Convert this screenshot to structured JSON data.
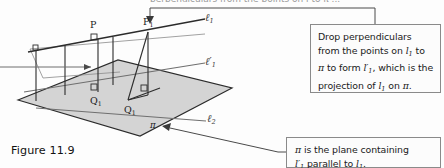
{
  "figure": {
    "caption": "Figure 11.9",
    "top_bleed_text": "perpendiculars from the points on  l  to  π  ...",
    "point_labels": [
      {
        "name": "P",
        "text": "P",
        "sub": "",
        "x": 93,
        "y": 27
      },
      {
        "name": "P1",
        "text": "P",
        "sub": "1",
        "x": 147,
        "y": 24
      },
      {
        "name": "Q",
        "text": "Q",
        "sub": "",
        "x": 93,
        "y": 95
      },
      {
        "name": "Q1",
        "text": "Q",
        "sub": "1",
        "x": 129,
        "y": 106
      }
    ],
    "line_labels": [
      {
        "name": "l1",
        "glyph": "ℓ",
        "sub": "1",
        "prime": false,
        "x": 208,
        "y": 15
      },
      {
        "name": "l1-prime",
        "glyph": "ℓ",
        "sub": "1",
        "prime": true,
        "x": 208,
        "y": 60
      },
      {
        "name": "l2",
        "glyph": "ℓ",
        "sub": "2",
        "prime": false,
        "x": 210,
        "y": 117
      }
    ],
    "plane_label": {
      "text": "π",
      "x": 152,
      "y": 125
    },
    "plane_fill": "#d4d4d4",
    "line_color": "#2b2b2b",
    "thin_line_color": "#7d7d7d"
  },
  "callouts": [
    {
      "name": "projection-callout",
      "lines": [
        {
          "parts": [
            {
              "t": "Drop perpendiculars",
              "k": "plain"
            }
          ]
        },
        {
          "parts": [
            {
              "t": "from the points on ",
              "k": "plain"
            },
            {
              "t": "l",
              "k": "var"
            },
            {
              "t": "1",
              "k": "sub"
            },
            {
              "t": " to",
              "k": "plain"
            }
          ]
        },
        {
          "parts": [
            {
              "t": "π",
              "k": "greek"
            },
            {
              "t": " to form ",
              "k": "plain"
            },
            {
              "t": "l′",
              "k": "var"
            },
            {
              "t": "1",
              "k": "sub"
            },
            {
              "t": ", which is the",
              "k": "plain"
            }
          ]
        },
        {
          "parts": [
            {
              "t": "projection of ",
              "k": "plain"
            },
            {
              "t": "l",
              "k": "var"
            },
            {
              "t": "1",
              "k": "sub"
            },
            {
              "t": " on ",
              "k": "plain"
            },
            {
              "t": "π",
              "k": "greek"
            },
            {
              "t": ".",
              "k": "plain"
            }
          ]
        }
      ]
    },
    {
      "name": "plane-callout",
      "lines": [
        {
          "parts": [
            {
              "t": "π",
              "k": "greek"
            },
            {
              "t": " is the plane containing",
              "k": "plain"
            }
          ]
        },
        {
          "parts": [
            {
              "t": "l′",
              "k": "var"
            },
            {
              "t": "1",
              "k": "sub"
            },
            {
              "t": " parallel to ",
              "k": "plain"
            },
            {
              "t": "l",
              "k": "var"
            },
            {
              "t": "1",
              "k": "sub"
            },
            {
              "t": ".",
              "k": "plain"
            }
          ]
        }
      ]
    }
  ]
}
